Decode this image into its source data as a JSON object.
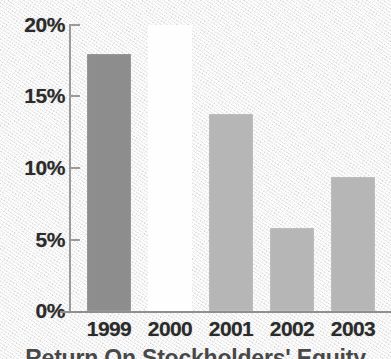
{
  "chart_data": {
    "type": "bar",
    "title": "",
    "caption": "Return On Stockholders' Equity",
    "xlabel": "",
    "ylabel": "",
    "categories": [
      "1999",
      "2000",
      "2001",
      "2002",
      "2003"
    ],
    "values": [
      18.0,
      20.0,
      13.8,
      5.8,
      9.4
    ],
    "value_labels": [
      "18.0%",
      "20.0%",
      "13.8%",
      "5.8%",
      "9.4%"
    ],
    "ylim": [
      0,
      20
    ],
    "ytick_labels": [
      "20%",
      "15%",
      "10%",
      "5%",
      "0%"
    ],
    "ytick_values": [
      20,
      15,
      10,
      5,
      0
    ],
    "grid": false,
    "legend": false,
    "legend_position": "none",
    "bar_colors": [
      "#8d8d8d",
      "#fefefe",
      "#b6b6b6",
      "#b6b6b6",
      "#b6b6b6"
    ],
    "highlighted_category": "2000",
    "series": [
      {
        "name": "Return On Stockholders' Equity",
        "values": [
          18.0,
          20.0,
          13.8,
          5.8,
          9.4
        ]
      }
    ]
  },
  "colors": {
    "background": "#ececec",
    "axis": "#9b9b9b",
    "text": "#2b2b2b",
    "bar_dark": "#8d8d8d",
    "bar_light": "#b6b6b6",
    "bar_highlight": "#fefefe"
  }
}
